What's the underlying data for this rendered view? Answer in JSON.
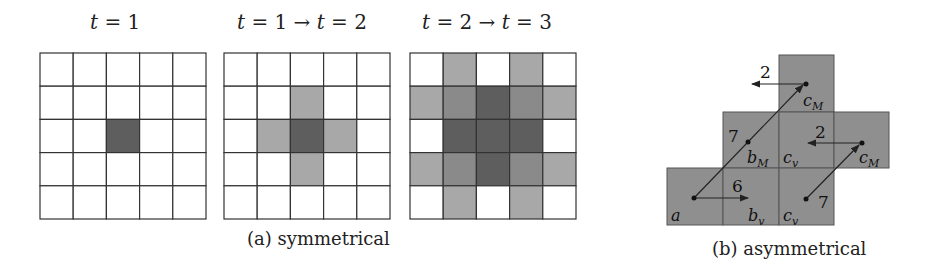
{
  "panel_a": {
    "caption": "(a) symmetrical",
    "grids": [
      {
        "title_var": "t",
        "title_text": " = 1",
        "cells": [
          [
            0,
            0,
            0,
            0,
            0
          ],
          [
            0,
            0,
            0,
            0,
            0
          ],
          [
            0,
            0,
            3,
            0,
            0
          ],
          [
            0,
            0,
            0,
            0,
            0
          ],
          [
            0,
            0,
            0,
            0,
            0
          ]
        ]
      },
      {
        "title_var": "t",
        "title_text": " = 1 → ",
        "title_var2": "t",
        "title_text2": " = 2",
        "cells": [
          [
            0,
            0,
            0,
            0,
            0
          ],
          [
            0,
            0,
            1,
            0,
            0
          ],
          [
            0,
            1,
            3,
            1,
            0
          ],
          [
            0,
            0,
            1,
            0,
            0
          ],
          [
            0,
            0,
            0,
            0,
            0
          ]
        ]
      },
      {
        "title_var": "t",
        "title_text": " = 2 → ",
        "title_var2": "t",
        "title_text2": " = 3",
        "cells": [
          [
            0,
            1,
            0,
            1,
            0
          ],
          [
            1,
            2,
            3,
            2,
            1
          ],
          [
            0,
            3,
            3,
            3,
            0
          ],
          [
            1,
            2,
            3,
            2,
            1
          ],
          [
            0,
            1,
            0,
            1,
            0
          ]
        ]
      }
    ],
    "shade_colors": [
      "#ffffff",
      "#a8a8a8",
      "#8a8a8a",
      "#5e5e5e"
    ]
  },
  "panel_b": {
    "caption": "(b) asymmetrical",
    "cell_fill": "#8f8f8f",
    "labels": {
      "a": "a",
      "b_v": "b",
      "b_v_sub": "v",
      "b_M": "b",
      "b_M_sub": "M",
      "c_v_mid": "c",
      "c_v_mid_sub": "v",
      "c_v_bot": "c",
      "c_v_bot_sub": "v",
      "c_M_top": "c",
      "c_M_top_sub": "M",
      "c_M_right": "c",
      "c_M_right_sub": "M"
    },
    "weights": {
      "a_to_bv": "6",
      "a_to_bM": "7",
      "cM_top_left": "2",
      "cM_right_left": "2",
      "cv_to_cM": "7"
    }
  }
}
